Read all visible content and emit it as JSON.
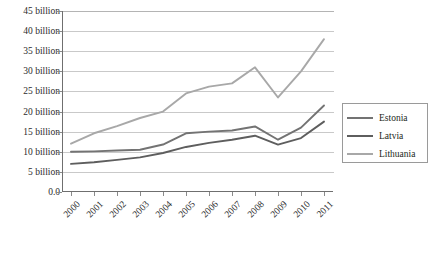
{
  "chart_data": {
    "type": "line",
    "title": "",
    "xlabel": "",
    "ylabel": "",
    "x": [
      "2000",
      "2001",
      "2002",
      "2003",
      "2004",
      "2005",
      "2006",
      "2007",
      "2008",
      "2009",
      "2010",
      "2011"
    ],
    "ylim": [
      0,
      45
    ],
    "ytick_values": [
      0,
      5,
      10,
      15,
      20,
      25,
      30,
      35,
      40,
      45
    ],
    "ytick_labels": [
      "0.0",
      "5 billion",
      "10 billion",
      "15 billion",
      "20 billion",
      "25 billion",
      "30 billion",
      "35 billion",
      "40 billion",
      "45 billion"
    ],
    "grid": true,
    "legend_position": "right",
    "series": [
      {
        "name": "Estonia",
        "color": "#737373",
        "values": [
          10.0,
          10.1,
          10.3,
          10.5,
          11.8,
          14.6,
          15.0,
          15.3,
          16.3,
          13.0,
          16.0,
          21.5
        ]
      },
      {
        "name": "Latvia",
        "color": "#5e5e5e",
        "values": [
          7.0,
          7.4,
          8.0,
          8.6,
          9.7,
          11.2,
          12.2,
          13.0,
          14.0,
          11.8,
          13.4,
          17.5
        ]
      },
      {
        "name": "Lithuania",
        "color": "#a8a8a8",
        "values": [
          12.0,
          14.6,
          16.4,
          18.4,
          20.0,
          24.5,
          26.2,
          27.0,
          31.0,
          23.5,
          30.0,
          38.0
        ]
      }
    ]
  },
  "legend": {
    "items": [
      {
        "label": "Estonia"
      },
      {
        "label": "Latvia"
      },
      {
        "label": "Lithuania"
      }
    ]
  },
  "colors": {
    "gridline": "#c9c9c9",
    "axis": "#6f6f6f",
    "text": "#231f20",
    "background": "#ffffff"
  }
}
